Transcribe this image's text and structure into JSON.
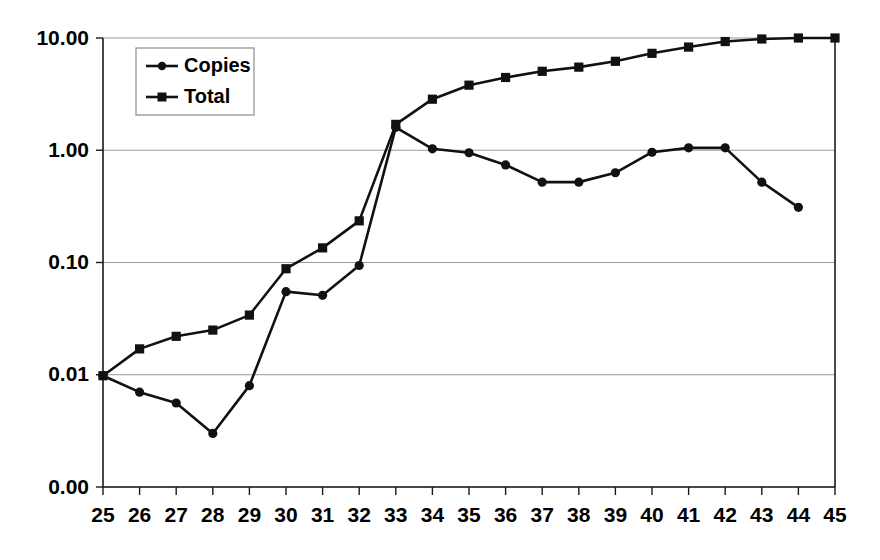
{
  "chart_data": {
    "type": "line",
    "title": "",
    "subtitle": "",
    "xlabel": "",
    "ylabel": "",
    "yscale": "log",
    "grid": true,
    "legend_position": "top-left",
    "x": [
      25,
      26,
      27,
      28,
      29,
      30,
      31,
      32,
      33,
      34,
      35,
      36,
      37,
      38,
      39,
      40,
      41,
      42,
      43,
      44,
      45
    ],
    "categories": [
      "25",
      "26",
      "27",
      "28",
      "29",
      "30",
      "31",
      "32",
      "33",
      "34",
      "35",
      "36",
      "37",
      "38",
      "39",
      "40",
      "41",
      "42",
      "43",
      "44",
      "45"
    ],
    "ytick_labels": [
      "10.00",
      "1.00",
      "0.10",
      "0.01",
      "0.00"
    ],
    "ytick_values": [
      10.0,
      1.0,
      0.1,
      0.01,
      0.001
    ],
    "ylim": [
      0.001,
      10.0
    ],
    "xlim": [
      25,
      45
    ],
    "series": [
      {
        "name": "Copies",
        "marker": "circle",
        "x": [
          25,
          26,
          27,
          28,
          29,
          30,
          31,
          32,
          33,
          34,
          35,
          36,
          37,
          38,
          39,
          40,
          41,
          42,
          43,
          44
        ],
        "values": [
          0.0098,
          0.007,
          0.0056,
          0.003,
          0.008,
          0.055,
          0.051,
          0.094,
          1.6,
          1.03,
          0.95,
          0.74,
          0.52,
          0.52,
          0.63,
          0.96,
          1.05,
          1.05,
          0.52,
          0.31
        ]
      },
      {
        "name": "Total",
        "marker": "square",
        "x": [
          25,
          26,
          27,
          28,
          29,
          30,
          31,
          32,
          33,
          34,
          35,
          36,
          37,
          38,
          39,
          40,
          41,
          42,
          43,
          44,
          45
        ],
        "values": [
          0.0098,
          0.017,
          0.022,
          0.025,
          0.034,
          0.088,
          0.135,
          0.235,
          1.7,
          2.85,
          3.8,
          4.45,
          5.05,
          5.5,
          6.2,
          7.3,
          8.3,
          9.3,
          9.8,
          10.0,
          10.0
        ]
      }
    ],
    "legend": [
      {
        "label": "Copies",
        "marker": "circle"
      },
      {
        "label": "Total",
        "marker": "square"
      }
    ]
  },
  "colors": {
    "series_stroke": "#111111",
    "gridline": "#9a9a9a",
    "axis": "#1a1a1a",
    "background": "#ffffff"
  }
}
